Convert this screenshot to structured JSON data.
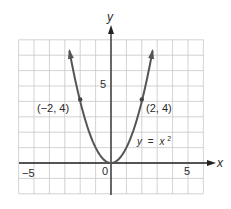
{
  "chart_data": {
    "type": "line",
    "title": "",
    "xlabel": "x",
    "ylabel": "y",
    "xlim": [
      -6,
      6
    ],
    "ylim": [
      -2,
      8
    ],
    "grid": true,
    "x_ticks": [
      {
        "value": -5,
        "label": "−5"
      },
      {
        "value": 0,
        "label": "0"
      },
      {
        "value": 5,
        "label": "5"
      }
    ],
    "y_ticks": [
      {
        "value": 5,
        "label": "5"
      }
    ],
    "series": [
      {
        "name": "y = x²",
        "function": "x^2",
        "x_range": [
          -2.7,
          2.7
        ],
        "arrows_at_ends": true
      }
    ],
    "points": [
      {
        "x": -2,
        "y": 4,
        "label": "(−2, 4)"
      },
      {
        "x": 2,
        "y": 4,
        "label": "(2, 4)"
      },
      {
        "x": 0,
        "y": 0,
        "label": "0"
      }
    ],
    "annotations": [
      {
        "text": "y = x²",
        "x": 2.3,
        "y": 1.6
      }
    ]
  },
  "labels": {
    "x_axis": "x",
    "y_axis": "y",
    "tick_neg5": "−5",
    "tick_origin": "0",
    "tick_pos5": "5",
    "tick_y5": "5",
    "point_left": "(−2, 4)",
    "point_right": "(2, 4)",
    "equation_y": "y",
    "equation_eq": "=",
    "equation_x": "x",
    "equation_exp": "2"
  },
  "colors": {
    "grid": "#c8c8c8",
    "axis": "#222222",
    "curve": "#555555"
  }
}
